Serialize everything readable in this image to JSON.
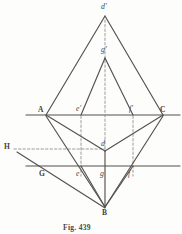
{
  "figure": {
    "caption": "Fig. 439",
    "background_color": "#fdfdfc",
    "ink_color": "#4a4745",
    "line_color": "#55514e",
    "dash_color": "#8e8a87",
    "points": [
      {
        "id": "d-prime",
        "label": "d'",
        "x": 105,
        "y": 14,
        "style": "ital",
        "lx": 101,
        "ly": 3
      },
      {
        "id": "g-prime",
        "label": "g'",
        "x": 105,
        "y": 57,
        "style": "ital",
        "lx": 101,
        "ly": 46
      },
      {
        "id": "A",
        "label": "A",
        "x": 46,
        "y": 115,
        "style": "cap",
        "lx": 38,
        "ly": 106
      },
      {
        "id": "e-prime",
        "label": "e'",
        "x": 81,
        "y": 115,
        "style": "ital",
        "lx": 76,
        "ly": 105
      },
      {
        "id": "f-prime",
        "label": "f'",
        "x": 133,
        "y": 115,
        "style": "ital",
        "lx": 129,
        "ly": 105
      },
      {
        "id": "C",
        "label": "C",
        "x": 163,
        "y": 115,
        "style": "cap",
        "lx": 160,
        "ly": 106
      },
      {
        "id": "d",
        "label": "d",
        "x": 105,
        "y": 151,
        "style": "ital",
        "lx": 101,
        "ly": 140
      },
      {
        "id": "H",
        "label": "H",
        "x": 10,
        "y": 150,
        "style": "cap",
        "lx": 4,
        "ly": 143
      },
      {
        "id": "G",
        "label": "G",
        "x": 45,
        "y": 174,
        "style": "cap",
        "lx": 39,
        "ly": 170
      },
      {
        "id": "e",
        "label": "e",
        "x": 81,
        "y": 174,
        "style": "ital",
        "lx": 76,
        "ly": 170
      },
      {
        "id": "g",
        "label": "g",
        "x": 105,
        "y": 174,
        "style": "ital",
        "lx": 100,
        "ly": 170
      },
      {
        "id": "f",
        "label": "f",
        "x": 133,
        "y": 174,
        "style": "ital",
        "lx": 128,
        "ly": 170
      },
      {
        "id": "B",
        "label": "B",
        "x": 105,
        "y": 209,
        "style": "cap",
        "lx": 102,
        "ly": 209
      }
    ],
    "solid_edges": [
      {
        "name": "edge-dprime-A",
        "x1": 105,
        "y1": 16,
        "x2": 46,
        "y2": 115
      },
      {
        "name": "edge-dprime-C",
        "x1": 105,
        "y1": 16,
        "x2": 163,
        "y2": 115
      },
      {
        "name": "edge-gprime-eprime",
        "x1": 105,
        "y1": 58,
        "x2": 81,
        "y2": 115
      },
      {
        "name": "edge-gprime-fprime",
        "x1": 105,
        "y1": 58,
        "x2": 133,
        "y2": 115
      },
      {
        "name": "edge-A-d",
        "x1": 46,
        "y1": 115,
        "x2": 105,
        "y2": 151
      },
      {
        "name": "edge-C-d",
        "x1": 163,
        "y1": 115,
        "x2": 105,
        "y2": 151
      },
      {
        "name": "edge-A-B",
        "x1": 46,
        "y1": 116,
        "x2": 105,
        "y2": 207
      },
      {
        "name": "edge-C-B",
        "x1": 163,
        "y1": 116,
        "x2": 105,
        "y2": 207
      },
      {
        "name": "edge-d-B",
        "x1": 105,
        "y1": 151,
        "x2": 105,
        "y2": 207
      },
      {
        "name": "edge-e-B",
        "x1": 81,
        "y1": 166,
        "x2": 105,
        "y2": 207
      },
      {
        "name": "edge-f-B",
        "x1": 133,
        "y1": 166,
        "x2": 105,
        "y2": 207
      },
      {
        "name": "edge-H-B",
        "x1": 17,
        "y1": 152,
        "x2": 105,
        "y2": 208
      }
    ],
    "axis_lines": [
      {
        "name": "axis-upper-horizontal",
        "x1": 26,
        "y1": 115,
        "x2": 180,
        "y2": 115
      },
      {
        "name": "axis-lower-horizontal",
        "x1": 26,
        "y1": 166,
        "x2": 180,
        "y2": 166
      }
    ],
    "dashed_edges": [
      {
        "name": "dash-dprime-gprime-d",
        "x1": 105,
        "y1": 20,
        "x2": 105,
        "y2": 151
      },
      {
        "name": "dash-eprime-e",
        "x1": 81,
        "y1": 116,
        "x2": 81,
        "y2": 176
      },
      {
        "name": "dash-fprime-f",
        "x1": 133,
        "y1": 116,
        "x2": 133,
        "y2": 176
      },
      {
        "name": "dash-H-d",
        "x1": 14,
        "y1": 149,
        "x2": 105,
        "y2": 149
      }
    ]
  }
}
